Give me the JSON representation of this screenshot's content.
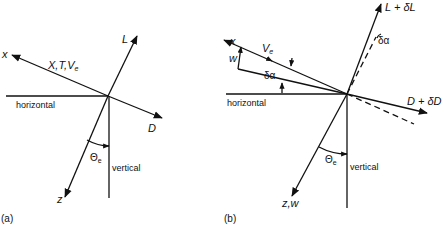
{
  "panel_a": {
    "caption": "(a)",
    "x_axis": "x",
    "x_vector_label_main": "X,T,V",
    "x_vector_label_sub": "e",
    "lift": "L",
    "drag": "D",
    "horizontal": "horizontal",
    "vertical": "vertical",
    "theta": "Θ",
    "theta_sub": "e",
    "z_axis": "z"
  },
  "panel_b": {
    "caption": "(b)",
    "x_axis": "x",
    "velocity": "V",
    "velocity_sub": "e",
    "w": "w",
    "delta_alpha": "δα",
    "delta_alpha_top": "δα",
    "lift": "L + δL",
    "drag": "D + δD",
    "horizontal": "horizontal",
    "vertical": "vertical",
    "theta": "Θ",
    "theta_sub": "e",
    "z_axis": "z,w"
  }
}
